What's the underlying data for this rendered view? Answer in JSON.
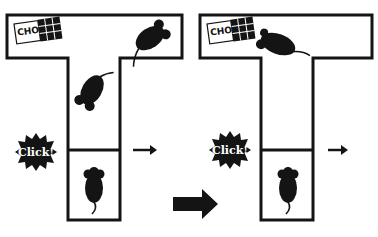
{
  "caption": "",
  "panels": [
    {
      "id": "before",
      "chocolate_label": "CHOC",
      "sound_label": "Click!",
      "mice": [
        "mouse-top-arm",
        "mouse-stem-walking",
        "mouse-start-box"
      ]
    },
    {
      "id": "after",
      "chocolate_label": "CHOC",
      "sound_label": "Click!",
      "mice": [
        "mouse-eating-chocolate",
        "mouse-start-box"
      ]
    }
  ],
  "transition_arrow": "arrow-right-icon",
  "colors": {
    "ink": "#141414",
    "paper": "#ffffff"
  }
}
